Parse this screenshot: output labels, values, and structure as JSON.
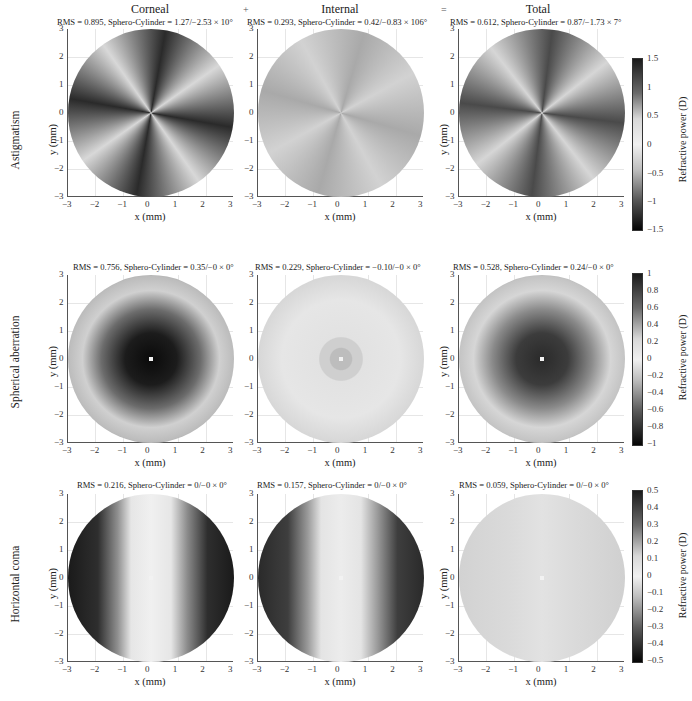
{
  "figure": {
    "column_titles": [
      "Corneal",
      "Internal",
      "Total"
    ],
    "operators": [
      "+",
      "="
    ],
    "row_labels": [
      "Astigmatism",
      "Spherical aberration",
      "Horizontal coma"
    ],
    "x_label": "x (mm)",
    "y_label": "y (mm)",
    "colorbar_label": "Refractive power (D)",
    "axis_ticks": [
      "-3",
      "-2",
      "-1",
      "0",
      "1",
      "2",
      "3"
    ],
    "y_ticks": [
      "3",
      "2",
      "1",
      "0",
      "-1",
      "-2",
      "-3"
    ]
  },
  "panels": [
    [
      {
        "subtitle": "RMS = 0.895, Sphero-Cylinder = 1.27/−2.53 × 10°"
      },
      {
        "subtitle": "RMS = 0.293, Sphero-Cylinder = 0.42/−0.83 × 106°"
      },
      {
        "subtitle": "RMS = 0.612, Sphero-Cylinder = 0.87/−1.73 × 7°"
      }
    ],
    [
      {
        "subtitle": "RMS = 0.756, Sphero-Cylinder = 0.35/−0 × 0°"
      },
      {
        "subtitle": "RMS = 0.229, Sphero-Cylinder = −0.10/−0 × 0°"
      },
      {
        "subtitle": "RMS = 0.528, Sphero-Cylinder = 0.24/−0 × 0°"
      }
    ],
    [
      {
        "subtitle": "RMS = 0.216, Sphero-Cylinder = 0/−0 × 0°"
      },
      {
        "subtitle": "RMS = 0.157, Sphero-Cylinder = 0/−0 × 0°"
      },
      {
        "subtitle": "RMS = 0.059, Sphero-Cylinder = 0/−0 × 0°"
      }
    ]
  ],
  "colorbars": [
    {
      "ticks": [
        "1.5",
        "1",
        "0.5",
        "0",
        "−0.5",
        "−1",
        "−1.5"
      ]
    },
    {
      "ticks": [
        "1",
        "0.8",
        "0.6",
        "0.4",
        "0.2",
        "0",
        "−0.2",
        "−0.4",
        "−0.6",
        "−0.8",
        "−1"
      ]
    },
    {
      "ticks": [
        "0.5",
        "0.4",
        "0.3",
        "0.2",
        "0.1",
        "0",
        "−0.1",
        "−0.2",
        "−0.3",
        "−0.4",
        "−0.5"
      ]
    }
  ],
  "chart_data": {
    "type": "heatmap",
    "columns": [
      "Corneal",
      "Internal",
      "Total"
    ],
    "rows": [
      "Astigmatism",
      "Spherical aberration",
      "Horizontal coma"
    ],
    "xlabel": "x (mm)",
    "ylabel": "y (mm)",
    "xlim": [
      -3,
      3
    ],
    "ylim": [
      -3,
      3
    ],
    "grid": true,
    "colormap": "grayscale (dark = high magnitude)",
    "colorbar_label": "Refractive power (D)",
    "colorbar_ranges": {
      "Astigmatism": [
        -1.5,
        1.5
      ],
      "Spherical aberration": [
        -1,
        1
      ],
      "Horizontal coma": [
        -0.5,
        0.5
      ]
    },
    "panels": [
      {
        "row": "Astigmatism",
        "column": "Corneal",
        "rms": 0.895,
        "sphere": 1.27,
        "cylinder": -2.53,
        "axis_deg": 10
      },
      {
        "row": "Astigmatism",
        "column": "Internal",
        "rms": 0.293,
        "sphere": 0.42,
        "cylinder": -0.83,
        "axis_deg": 106
      },
      {
        "row": "Astigmatism",
        "column": "Total",
        "rms": 0.612,
        "sphere": 0.87,
        "cylinder": -1.73,
        "axis_deg": 7
      },
      {
        "row": "Spherical aberration",
        "column": "Corneal",
        "rms": 0.756,
        "sphere": 0.35,
        "cylinder": 0,
        "axis_deg": 0
      },
      {
        "row": "Spherical aberration",
        "column": "Internal",
        "rms": 0.229,
        "sphere": -0.1,
        "cylinder": 0,
        "axis_deg": 0
      },
      {
        "row": "Spherical aberration",
        "column": "Total",
        "rms": 0.528,
        "sphere": 0.24,
        "cylinder": 0,
        "axis_deg": 0
      },
      {
        "row": "Horizontal coma",
        "column": "Corneal",
        "rms": 0.216,
        "sphere": 0,
        "cylinder": 0,
        "axis_deg": 0
      },
      {
        "row": "Horizontal coma",
        "column": "Internal",
        "rms": 0.157,
        "sphere": 0,
        "cylinder": 0,
        "axis_deg": 0
      },
      {
        "row": "Horizontal coma",
        "column": "Total",
        "rms": 0.059,
        "sphere": 0,
        "cylinder": 0,
        "axis_deg": 0
      }
    ]
  }
}
